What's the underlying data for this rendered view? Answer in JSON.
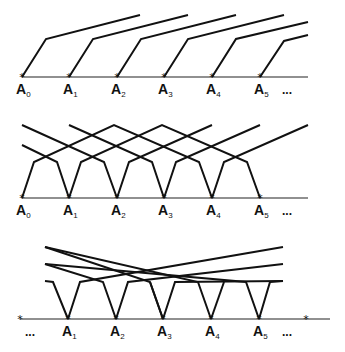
{
  "diagram": {
    "panels": [
      {
        "id": "panel-1",
        "baseline": {
          "y": 77,
          "x1": 22,
          "x2": 308
        },
        "points": [
          {
            "name": "A",
            "sub": "0",
            "x": 22
          },
          {
            "name": "A",
            "sub": "1",
            "x": 69
          },
          {
            "name": "A",
            "sub": "2",
            "x": 117
          },
          {
            "name": "A",
            "sub": "3",
            "x": 164
          },
          {
            "name": "A",
            "sub": "4",
            "x": 212
          },
          {
            "name": "A",
            "sub": "5",
            "x": 260
          }
        ],
        "ellipsis": "...",
        "polylines": [
          "22,77 46,39 140,15",
          "69,77 93,39 188,15",
          "117,77 141,39 236,15",
          "164,77 188,39 284,15",
          "212,77 236,39 308,22",
          "260,77 284,41 308,35"
        ]
      },
      {
        "id": "panel-2",
        "baseline": {
          "y": 198,
          "x1": 22,
          "x2": 308
        },
        "points": [
          {
            "name": "A",
            "sub": "0",
            "x": 22
          },
          {
            "name": "A",
            "sub": "1",
            "x": 69
          },
          {
            "name": "A",
            "sub": "2",
            "x": 117
          },
          {
            "name": "A",
            "sub": "3",
            "x": 164
          },
          {
            "name": "A",
            "sub": "4",
            "x": 212
          },
          {
            "name": "A",
            "sub": "5",
            "x": 260
          }
        ],
        "ellipsis": "...",
        "polylines": [
          "22,198 34,162 114,125 199,162 212,198",
          "69,198 81,162 162,125 247,162 260,198",
          "117,198 129,162 212,125",
          "164,198 176,162 260,125",
          "212,198 224,162 308,125",
          "22,145 57,162 69,198",
          "22,125 104,162 117,198",
          "69,125 152,162 164,198"
        ]
      },
      {
        "id": "panel-3",
        "baseline": {
          "y": 319,
          "x1": 20,
          "x2": 330
        },
        "stars": [
          {
            "x": 20,
            "y": 319
          },
          {
            "x": 306,
            "y": 319
          }
        ],
        "points": [
          {
            "name": "A",
            "sub": "1",
            "x": 68
          },
          {
            "name": "A",
            "sub": "2",
            "x": 116
          },
          {
            "name": "A",
            "sub": "3",
            "x": 163
          },
          {
            "name": "A",
            "sub": "4",
            "x": 211
          },
          {
            "name": "A",
            "sub": "5",
            "x": 259
          }
        ],
        "ellipsis_left": "...",
        "ellipsis_right": "...",
        "polylines": [
          "45,281 53,282 68,319",
          "45,264 103,282 116,319",
          "45,247 150,282 163,319",
          "68,319 80,282 283,247",
          "116,319 128,282 283,264",
          "163,319 175,282 283,281",
          "163,319 150,282",
          "211,319 198,282 45,247",
          "211,319 224,282",
          "259,319 246,282 45,264",
          "259,319 270,282 283,281"
        ]
      }
    ]
  }
}
